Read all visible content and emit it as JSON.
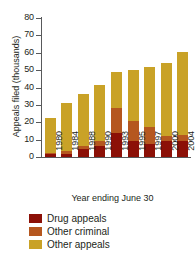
{
  "chart_data": {
    "type": "bar",
    "subtype": "stacked-vertical",
    "title": "",
    "xlabel": "Year ending June 30",
    "ylabel": "Appeals filed (thousands)",
    "categories": [
      "1980",
      "1984",
      "1988",
      "1990",
      "1993",
      "1995",
      "1997",
      "2000",
      "2004"
    ],
    "series": [
      {
        "name": "Drug appeals",
        "color": "#8C1007",
        "values": [
          1.5,
          2.0,
          4.5,
          6.5,
          14.0,
          9.0,
          7.5,
          9.0,
          9.5
        ]
      },
      {
        "name": "Other criminal",
        "color": "#B5571F",
        "values": [
          1.0,
          1.5,
          2.0,
          2.5,
          14.0,
          12.0,
          9.5,
          3.0,
          3.0
        ]
      },
      {
        "name": "Other appeals",
        "color": "#C9A227",
        "values": [
          20.0,
          27.5,
          30.0,
          32.5,
          21.0,
          29.0,
          35.0,
          42.0,
          48.0
        ]
      }
    ],
    "totals": [
      22.5,
      31.0,
      36.5,
      41.5,
      49.0,
      50.0,
      52.0,
      54.0,
      60.5
    ],
    "ylim": [
      0,
      80
    ],
    "yticks": [
      0,
      10,
      20,
      30,
      40,
      50,
      60,
      70,
      80
    ],
    "ytick_labels": [
      "0",
      "10",
      "20",
      "30",
      "40",
      "50",
      "60",
      "70",
      "80"
    ],
    "grid": false,
    "legend_position": "bottom-left"
  },
  "legend": {
    "items": [
      {
        "label": "Drug appeals",
        "color": "#8C1007"
      },
      {
        "label": "Other criminal",
        "color": "#B5571F"
      },
      {
        "label": "Other appeals",
        "color": "#C9A227"
      }
    ]
  },
  "axes": {
    "y_title": "Appeals filed (thousands)",
    "x_title": "Year ending June 30"
  }
}
